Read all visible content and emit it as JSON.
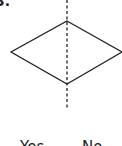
{
  "diagram": {
    "step_number": "3.",
    "shape": "decision-diamond",
    "branches": {
      "yes_label": "Yes",
      "no_label": "No"
    },
    "colors": {
      "stroke": "#222222",
      "background": "#ffffff"
    }
  }
}
